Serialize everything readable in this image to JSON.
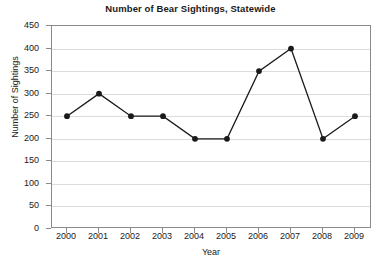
{
  "chart_data": {
    "type": "line",
    "title": "Number of Bear Sightings, Statewide",
    "xlabel": "Year",
    "ylabel": "Number of Sightings",
    "categories": [
      "2000",
      "2001",
      "2002",
      "2003",
      "2004",
      "2005",
      "2006",
      "2007",
      "2008",
      "2009"
    ],
    "values": [
      250,
      300,
      250,
      250,
      200,
      200,
      350,
      400,
      200,
      250
    ],
    "series": [
      {
        "name": "Bear Sightings",
        "values": [
          250,
          300,
          250,
          250,
          200,
          200,
          350,
          400,
          200,
          250
        ]
      }
    ],
    "ylim": [
      0,
      450
    ],
    "yticks": [
      "0",
      "50",
      "100",
      "150",
      "200",
      "250",
      "300",
      "350",
      "400",
      "450"
    ],
    "ytick_values": [
      0,
      50,
      100,
      150,
      200,
      250,
      300,
      350,
      400,
      450
    ],
    "xlim_categories": [
      "2000",
      "2009"
    ],
    "grid": "horizontal",
    "legend": "none",
    "marker": "filled-circle",
    "line_color": "#1a1a1a",
    "marker_color": "#1a1a1a",
    "grid_color": "#dcdcdc",
    "axis_color": "#8a8a8a",
    "background_color": "#ffffff"
  }
}
